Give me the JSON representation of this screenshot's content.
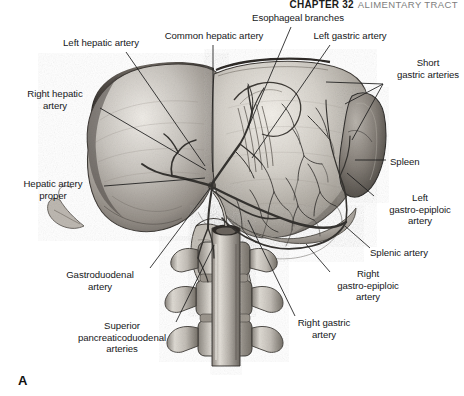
{
  "running_head": {
    "chapter_number": "CHAPTER 32",
    "chapter_title": "ALIMENTARY TRACT"
  },
  "figure": {
    "letter": "A",
    "caption": "",
    "type": "anatomical-illustration",
    "rendering": "grayscale pen-and-ink / airbrush halftone"
  },
  "labels": [
    {
      "id": "esophageal-branches",
      "text": "Esophageal branches",
      "x": 238,
      "y": 12,
      "align": "c",
      "width": 120
    },
    {
      "id": "common-hepatic-artery",
      "text": "Common hepatic artery",
      "x": 152,
      "y": 30,
      "align": "c",
      "width": 124
    },
    {
      "id": "left-gastric-artery",
      "text": "Left gastric artery",
      "x": 298,
      "y": 30,
      "align": "c",
      "width": 104
    },
    {
      "id": "left-hepatic-artery",
      "text": "Left hepatic artery",
      "x": 49,
      "y": 37,
      "align": "c",
      "width": 104
    },
    {
      "id": "short-gastric-arteries",
      "text": "Short\ngastric arteries",
      "x": 392,
      "y": 57,
      "align": "c",
      "width": 72
    },
    {
      "id": "right-hepatic-artery",
      "text": "Right hepatic\nartery",
      "x": 12,
      "y": 88,
      "align": "c",
      "width": 86
    },
    {
      "id": "spleen",
      "text": "Spleen",
      "x": 390,
      "y": 156,
      "align": "l",
      "width": 60
    },
    {
      "id": "hepatic-artery-proper",
      "text": "Hepatic artery\nproper",
      "x": 8,
      "y": 178,
      "align": "c",
      "width": 90
    },
    {
      "id": "left-gastro-epiploic-artery",
      "text": "Left\ngastro-epiploic\nartery",
      "x": 378,
      "y": 192,
      "align": "c",
      "width": 84
    },
    {
      "id": "splenic-artery",
      "text": "Splenic artery",
      "x": 370,
      "y": 247,
      "align": "l",
      "width": 88
    },
    {
      "id": "gastroduodenal-artery",
      "text": "Gastroduodenal\nartery",
      "x": 51,
      "y": 269,
      "align": "c",
      "width": 98
    },
    {
      "id": "right-gastro-epiploic-artery",
      "text": "Right\ngastro-epiploic\nartery",
      "x": 326,
      "y": 268,
      "align": "c",
      "width": 84
    },
    {
      "id": "superior-pancreaticoduodenal-arteries",
      "text": "Superior\npancreaticoduodenal\narteries",
      "x": 64,
      "y": 320,
      "align": "c",
      "width": 116
    },
    {
      "id": "right-gastric-artery",
      "text": "Right gastric\nartery",
      "x": 284,
      "y": 317,
      "align": "c",
      "width": 80
    }
  ],
  "leader_lines": [
    {
      "id": "leader-left-hepatic-artery",
      "from": [
        126,
        52
      ],
      "to": [
        205,
        166
      ]
    },
    {
      "id": "leader-common-hepatic-artery",
      "from": [
        213,
        45
      ],
      "to": [
        213,
        172
      ]
    },
    {
      "id": "leader-esophageal-branches",
      "from": [
        291,
        27
      ],
      "to": [
        248,
        128
      ]
    },
    {
      "id": "leader-left-gastric-artery",
      "from": [
        330,
        45
      ],
      "to": [
        252,
        158
      ]
    },
    {
      "id": "leader-short-gastric-arteries-1",
      "from": [
        383,
        84
      ],
      "to": [
        326,
        82
      ]
    },
    {
      "id": "leader-short-gastric-arteries-2",
      "from": [
        383,
        84
      ],
      "to": [
        345,
        104
      ]
    },
    {
      "id": "leader-short-gastric-arteries-3",
      "from": [
        383,
        84
      ],
      "to": [
        352,
        140
      ]
    },
    {
      "id": "leader-right-hepatic-artery",
      "from": [
        100,
        108
      ],
      "to": [
        206,
        170
      ]
    },
    {
      "id": "leader-spleen",
      "from": [
        386,
        160
      ],
      "to": [
        355,
        160
      ]
    },
    {
      "id": "leader-hepatic-artery-proper",
      "from": [
        104,
        186
      ],
      "to": [
        205,
        178
      ]
    },
    {
      "id": "leader-left-gastro-epiploic-artery",
      "from": [
        374,
        196
      ],
      "to": [
        347,
        173
      ]
    },
    {
      "id": "leader-splenic-artery",
      "from": [
        370,
        248
      ],
      "to": [
        345,
        226
      ]
    },
    {
      "id": "leader-gastroduodenal-artery",
      "from": [
        150,
        268
      ],
      "to": [
        210,
        188
      ]
    },
    {
      "id": "leader-right-gastro-epiploic-artery",
      "from": [
        330,
        272
      ],
      "to": [
        306,
        244
      ]
    },
    {
      "id": "leader-superior-pancreaticoduodenal",
      "from": [
        176,
        322
      ],
      "to": [
        214,
        245
      ]
    },
    {
      "id": "leader-right-gastric-artery",
      "from": [
        295,
        316
      ],
      "to": [
        248,
        220
      ]
    }
  ],
  "colors": {
    "page_background": "#ffffff",
    "label_text": "#16181a",
    "leader_line": "#1b1b1b",
    "running_head_number": "#1a1a1a",
    "running_head_title": "#7d7d7d",
    "organ_midtone": "#b9b6b1",
    "organ_shadow": "#4d4a47",
    "organ_highlight": "#ece9e4",
    "vessel_stroke": "#3a3835",
    "bone_fill": "#cfccc6"
  }
}
